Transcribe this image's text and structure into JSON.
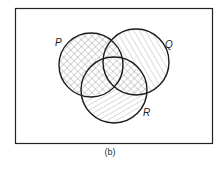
{
  "diagram": {
    "type": "venn",
    "caption": "(b)",
    "universe_border_color": "#222222",
    "sets": [
      {
        "id": "P",
        "label": "P",
        "cx": 91,
        "cy": 65,
        "r": 32
      },
      {
        "id": "Q",
        "label": "Q",
        "cx": 136,
        "cy": 62,
        "r": 33
      },
      {
        "id": "R",
        "label": "R",
        "cx": 114,
        "cy": 90,
        "r": 33
      }
    ],
    "shading": {
      "P": "cross-hatch",
      "Q_only": "diagonal-hatch-steep",
      "R_only": "diagonal-hatch-shallow",
      "Q_and_R": "cross-hatch"
    },
    "colors": {
      "outline": "#1a1a1a",
      "hatch": "#8a8a8a",
      "background": "#ffffff"
    }
  }
}
